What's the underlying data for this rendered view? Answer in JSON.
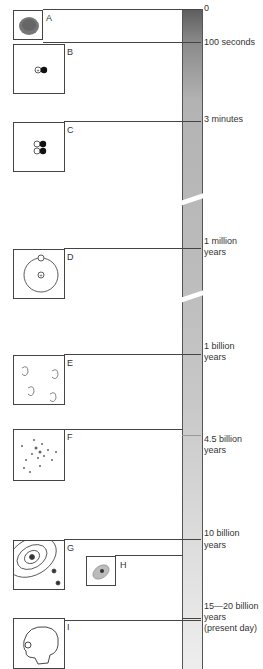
{
  "diagram": {
    "type": "timeline",
    "timescale_labels": [
      {
        "id": "t0",
        "text": "0"
      },
      {
        "id": "t1",
        "text": "100 seconds"
      },
      {
        "id": "t2",
        "text": "3 minutes"
      },
      {
        "id": "t3a",
        "text": "1 million"
      },
      {
        "id": "t3b",
        "text": "years"
      },
      {
        "id": "t4a",
        "text": "1 billion"
      },
      {
        "id": "t4b",
        "text": "years"
      },
      {
        "id": "t5a",
        "text": "4.5 billion"
      },
      {
        "id": "t5b",
        "text": "years"
      },
      {
        "id": "t6a",
        "text": "10 billion"
      },
      {
        "id": "t6b",
        "text": "years"
      },
      {
        "id": "t7a",
        "text": "15—20 billion"
      },
      {
        "id": "t7b",
        "text": "years"
      },
      {
        "id": "t7c",
        "text": "(present day)"
      }
    ],
    "panels": [
      {
        "letter": "A",
        "depicts": "primordial fireball"
      },
      {
        "letter": "B",
        "depicts": "proton and neutron"
      },
      {
        "letter": "C",
        "depicts": "helium nucleus"
      },
      {
        "letter": "D",
        "depicts": "atom with electron orbit"
      },
      {
        "letter": "E",
        "depicts": "young galaxies"
      },
      {
        "letter": "F",
        "depicts": "spiral galaxy"
      },
      {
        "letter": "G",
        "depicts": "solar system orbits"
      },
      {
        "letter": "H",
        "depicts": "cell"
      },
      {
        "letter": "I",
        "depicts": "human skull"
      }
    ],
    "bar_colors": {
      "top": "#5d5d5d",
      "middle": "#bcbcbc",
      "bottom": "#eeeeee"
    }
  }
}
